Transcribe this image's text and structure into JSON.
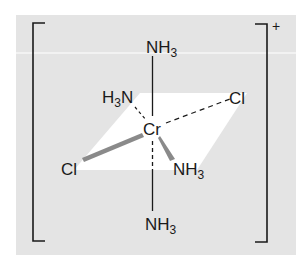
{
  "complex": {
    "metal": "Cr",
    "charge": "+",
    "ligands": {
      "top": {
        "main": "NH",
        "sub": "3"
      },
      "bottom": {
        "main": "NH",
        "sub": "3"
      },
      "back_left": {
        "pre": "H",
        "sub": "3",
        "post": "N"
      },
      "back_right": {
        "main": "Cl"
      },
      "front_left": {
        "main": "Cl"
      },
      "front_right": {
        "main": "NH",
        "sub": "3"
      }
    }
  },
  "colors": {
    "panel": "#e4e4e4",
    "plane": "#ffffff",
    "ink": "#1a1a1a",
    "wedge": "#8a8a8a"
  }
}
